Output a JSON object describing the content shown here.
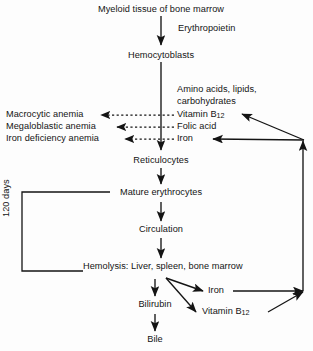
{
  "diagram": {
    "ink_color": "#141414",
    "background_color": "#fdfdfd",
    "nodes": {
      "myeloid_tissue": "Myeloid tissue of bone marrow",
      "erythropoietin": "Erythropoietin",
      "hemocytoblasts": "Hemocytoblasts",
      "amino_acids_line1": "Amino acids, lipids,",
      "amino_acids_line2": "carbohydrates",
      "vitamin_b12_mid": "Vitamin B",
      "vitamin_b12_mid_sub": "12",
      "folic_acid": "Folic acid",
      "iron_mid": "Iron",
      "macrocytic_anemia": "Macrocytic anemia",
      "megaloblastic_anemia": "Megaloblastic anemia",
      "iron_deficiency_anemia": "Iron deficiency anemia",
      "reticulocytes": "Reticulocytes",
      "mature_erythrocytes": "Mature erythrocytes",
      "days_label": "120 days",
      "circulation": "Circulation",
      "hemolysis": "Hemolysis: Liver, spleen, bone marrow",
      "bilirubin": "Bilirubin",
      "bile": "Bile",
      "iron_recycled": "Iron",
      "vitamin_b12_recycled": "Vitamin B",
      "vitamin_b12_recycled_sub": "12"
    }
  }
}
